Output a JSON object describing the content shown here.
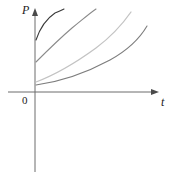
{
  "figure": {
    "background_color": "#ffffff",
    "width": 175,
    "height": 177
  },
  "axes": {
    "vertical": {
      "label": "P",
      "name": "p-axis",
      "color": "#6d6d6d",
      "x": 35,
      "y_top": 8,
      "y_bottom": 172,
      "arrow_at": "top"
    },
    "horizontal": {
      "label": "t",
      "name": "t-axis",
      "color": "#6d6d6d",
      "y": 92,
      "x_left": 8,
      "x_right": 159,
      "arrow_at": "right"
    },
    "origin": {
      "label": "0",
      "x": 35,
      "y": 92
    }
  },
  "chart_data": {
    "type": "line",
    "title": "",
    "xlabel": "t",
    "ylabel": "P",
    "xlim": [
      0,
      10
    ],
    "ylim": [
      0,
      10
    ],
    "grid": false,
    "legend": "none",
    "series": [
      {
        "name": "curve-1",
        "color": "#3a3a3a",
        "stroke_width": 1.1,
        "start_point": {
          "t": 0,
          "P": 40
        },
        "end_point": {
          "t": 62,
          "P": 10
        },
        "path": "M 36,40 C 40,28 46,19 55,13 C 60,11 62,10 64,9",
        "points": [
          {
            "x": 36,
            "y": 40
          },
          {
            "x": 42,
            "y": 28
          },
          {
            "x": 49,
            "y": 20
          },
          {
            "x": 56,
            "y": 14
          },
          {
            "x": 64,
            "y": 9
          }
        ]
      },
      {
        "name": "curve-2",
        "color": "#8a8a8a",
        "stroke_width": 1.1,
        "start_point": {
          "t": 0,
          "P": 62
        },
        "end_point": {
          "t": 94,
          "P": 10
        },
        "path": "M 36,62 C 46,52 58,40 72,28 C 82,20 90,13 96,9",
        "points": [
          {
            "x": 36,
            "y": 62
          },
          {
            "x": 50,
            "y": 48
          },
          {
            "x": 64,
            "y": 35
          },
          {
            "x": 80,
            "y": 22
          },
          {
            "x": 96,
            "y": 9
          }
        ]
      },
      {
        "name": "curve-3",
        "color": "#c3c3c3",
        "stroke_width": 1.3,
        "start_point": {
          "t": 0,
          "P": 80
        },
        "end_point": {
          "t": 128,
          "P": 12
        },
        "path": "M 36,82 C 52,76 74,64 96,48 C 112,36 124,22 131,12",
        "points": [
          {
            "x": 36,
            "y": 82
          },
          {
            "x": 60,
            "y": 72
          },
          {
            "x": 84,
            "y": 56
          },
          {
            "x": 108,
            "y": 38
          },
          {
            "x": 131,
            "y": 12
          }
        ]
      },
      {
        "name": "curve-4",
        "color": "#7d7d7d",
        "stroke_width": 1.1,
        "start_point": {
          "t": 0,
          "P": 84
        },
        "end_point": {
          "t": 145,
          "P": 26
        },
        "path": "M 36,85 C 58,82 84,74 110,60 C 128,50 140,38 147,26",
        "points": [
          {
            "x": 36,
            "y": 85
          },
          {
            "x": 64,
            "y": 80
          },
          {
            "x": 92,
            "y": 69
          },
          {
            "x": 122,
            "y": 50
          },
          {
            "x": 147,
            "y": 26
          }
        ]
      }
    ]
  }
}
